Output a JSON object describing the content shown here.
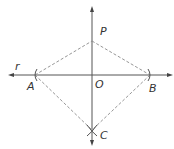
{
  "diagram": {
    "type": "geometric-construction",
    "labels": {
      "line": "r",
      "point_a": "A",
      "point_b": "B",
      "point_o": "O",
      "point_p": "P",
      "point_c": "C"
    },
    "points": {
      "A": [
        35,
        75
      ],
      "B": [
        150,
        75
      ],
      "O": [
        92,
        75
      ],
      "P": [
        92,
        41
      ],
      "C": [
        92,
        130
      ]
    },
    "colors": {
      "solid_line": "#555555",
      "dashed_line": "#8a8a8a",
      "label": "#333333"
    }
  }
}
